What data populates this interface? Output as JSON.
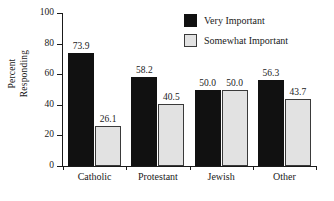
{
  "chart_data": {
    "type": "bar",
    "title": "",
    "xlabel": "",
    "ylabel": "Percent Responding",
    "ylabel_line1": "Percent",
    "ylabel_line2": "Responding",
    "ylim": [
      0,
      100
    ],
    "yticks": [
      0,
      20,
      40,
      60,
      80,
      100
    ],
    "ytick_labels": [
      "0",
      "20",
      "40",
      "60",
      "80",
      "100"
    ],
    "grid": false,
    "legend_position": "top-right",
    "categories": [
      "Catholic",
      "Protestant",
      "Jewish",
      "Other"
    ],
    "series": [
      {
        "name": "Very Important",
        "color": "#111111",
        "values": [
          73.9,
          58.2,
          50.0,
          56.3
        ],
        "value_labels": [
          "73.9",
          "58.2",
          "50.0",
          "56.3"
        ]
      },
      {
        "name": "Somewhat Important",
        "color": "#e2e2e2",
        "values": [
          26.1,
          40.5,
          50.0,
          43.7
        ],
        "value_labels": [
          "26.1",
          "40.5",
          "50.0",
          "43.7"
        ]
      }
    ]
  },
  "legend": {
    "items": [
      {
        "label": "Very Important",
        "swatch": "black-square-swatch"
      },
      {
        "label": "Somewhat Important",
        "swatch": "gray-square-swatch"
      }
    ]
  }
}
